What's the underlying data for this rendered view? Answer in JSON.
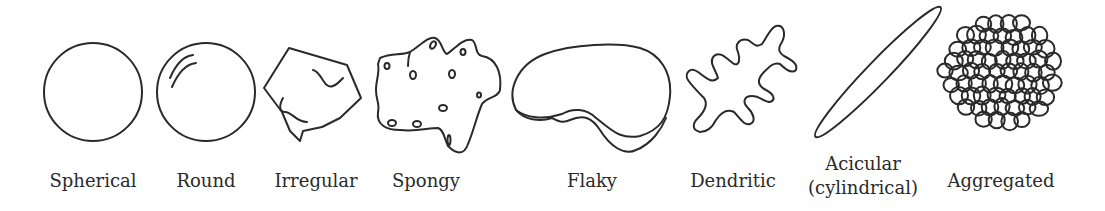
{
  "figure": {
    "type": "particle-shape-diagram",
    "stroke_color": "#2a2a2a",
    "background": "#ffffff",
    "shapes": [
      {
        "id": "spherical",
        "label": "Spherical"
      },
      {
        "id": "round",
        "label": "Round"
      },
      {
        "id": "irregular",
        "label": "Irregular"
      },
      {
        "id": "spongy",
        "label": "Spongy"
      },
      {
        "id": "flaky",
        "label": "Flaky"
      },
      {
        "id": "dendritic",
        "label": "Dendritic"
      },
      {
        "id": "acicular",
        "label": "Acicular",
        "sublabel": "(cylindrical)"
      },
      {
        "id": "aggregated",
        "label": "Aggregated"
      }
    ]
  }
}
